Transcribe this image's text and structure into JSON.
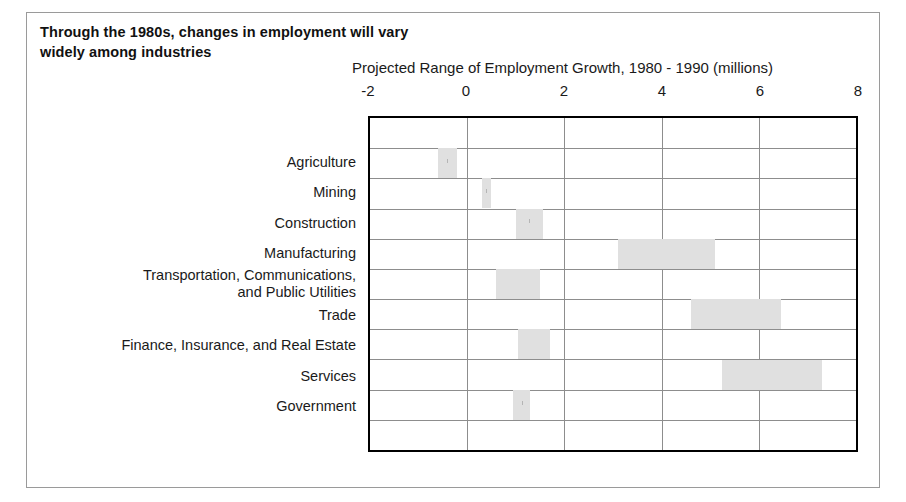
{
  "figure": {
    "title_line1": "Through the 1980s, changes in employment will vary",
    "title_line2": "widely among industries",
    "axis_caption": "Projected Range of Employment Growth, 1980 - 1990 (millions)"
  },
  "chart_data": {
    "type": "bar",
    "orientation": "horizontal",
    "subtype": "range-bar",
    "title": "Through the 1980s, changes in employment will vary widely among industries",
    "xlabel": "Projected Range of Employment Growth, 1980 - 1990 (millions)",
    "ylabel": "",
    "xlim": [
      -2,
      8
    ],
    "xticks": [
      -2,
      0,
      2,
      4,
      6,
      8
    ],
    "xtick_labels": [
      "-2",
      "0",
      "2",
      "4",
      "6",
      "8"
    ],
    "grid": "both",
    "legend": "none",
    "bar_color": "#e0e0e0",
    "categories": [
      "Agriculture",
      "Mining",
      "Construction",
      "Manufacturing",
      "Transportation, Communications,\nand Public Utilities",
      "Trade",
      "Finance, Insurance, and Real Estate",
      "Services",
      "Government"
    ],
    "ranges": [
      {
        "category": "Agriculture",
        "low": -0.6,
        "high": -0.2
      },
      {
        "category": "Mining",
        "low": 0.3,
        "high": 0.5
      },
      {
        "category": "Construction",
        "low": 1.0,
        "high": 1.55
      },
      {
        "category": "Manufacturing",
        "low": 3.1,
        "high": 5.1
      },
      {
        "category": "Transportation, Communications, and Public Utilities",
        "low": 0.6,
        "high": 1.5
      },
      {
        "category": "Trade",
        "low": 4.6,
        "high": 6.45
      },
      {
        "category": "Finance, Insurance, and Real Estate",
        "low": 1.05,
        "high": 1.7
      },
      {
        "category": "Services",
        "low": 5.25,
        "high": 7.3
      },
      {
        "category": "Government",
        "low": 0.95,
        "high": 1.3
      }
    ]
  }
}
